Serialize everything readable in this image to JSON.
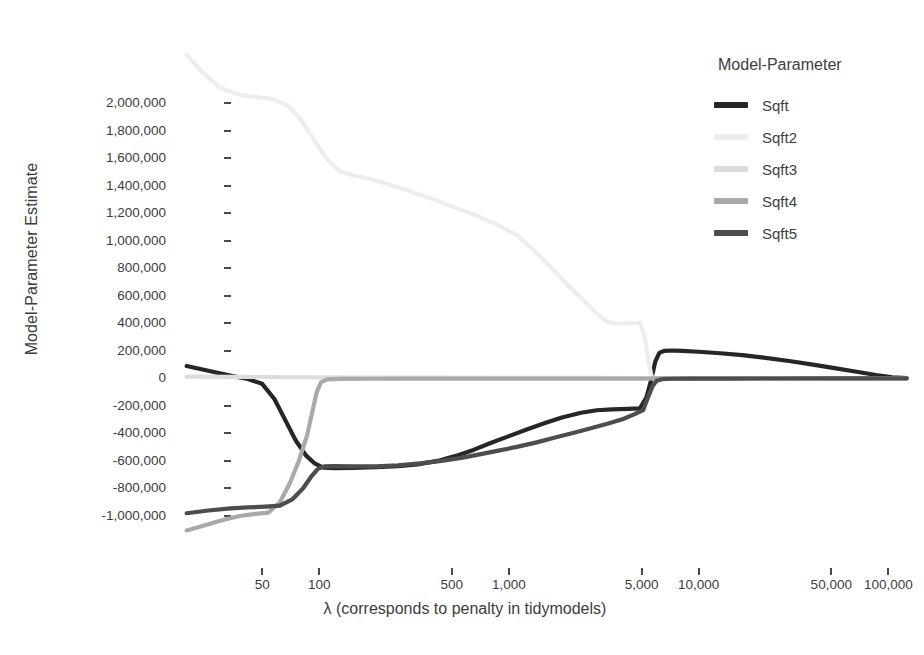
{
  "chart_data": {
    "type": "line",
    "title": "",
    "xlabel": "λ (corresponds to penalty in tidymodels)",
    "ylabel": "Model-Parameter Estimate",
    "xscale": "log",
    "xlim": [
      18,
      130000
    ],
    "ylim": [
      -1150000,
      2150000
    ],
    "grid": false,
    "legend": {
      "title": "Model-Parameter",
      "position": "right",
      "entries": [
        "Sqft",
        "Sqft2",
        "Sqft3",
        "Sqft4",
        "Sqft5"
      ]
    },
    "xticks": [
      {
        "value": 50,
        "label": "50"
      },
      {
        "value": 100,
        "label": "100"
      },
      {
        "value": 500,
        "label": "500"
      },
      {
        "value": 1000,
        "label": "1,000"
      },
      {
        "value": 5000,
        "label": "5,000"
      },
      {
        "value": 10000,
        "label": "10,000"
      },
      {
        "value": 50000,
        "label": "50,000"
      },
      {
        "value": 100000,
        "label": "100,000"
      }
    ],
    "yticks": [
      {
        "value": 2000000,
        "label": "2,000,000"
      },
      {
        "value": 1800000,
        "label": "1,800,000"
      },
      {
        "value": 1600000,
        "label": "1,600,000"
      },
      {
        "value": 1400000,
        "label": "1,400,000"
      },
      {
        "value": 1200000,
        "label": "1,200,000"
      },
      {
        "value": 1000000,
        "label": "1,000,000"
      },
      {
        "value": 800000,
        "label": "800,000"
      },
      {
        "value": 600000,
        "label": "600,000"
      },
      {
        "value": 400000,
        "label": "400,000"
      },
      {
        "value": 200000,
        "label": "200,000"
      },
      {
        "value": 0,
        "label": "0"
      },
      {
        "value": -200000,
        "label": "-200,000"
      },
      {
        "value": -400000,
        "label": "-400,000"
      },
      {
        "value": -600000,
        "label": "-600,000"
      },
      {
        "value": -800000,
        "label": "-800,000"
      },
      {
        "value": -1000000,
        "label": "-1,000,000"
      }
    ],
    "series": [
      {
        "name": "Sqft",
        "color": "#262626",
        "width": 4.2,
        "points": [
          [
            20,
            90000
          ],
          [
            26,
            55000
          ],
          [
            34,
            20000
          ],
          [
            42,
            -5000
          ],
          [
            50,
            -40000
          ],
          [
            58,
            -150000
          ],
          [
            66,
            -300000
          ],
          [
            75,
            -450000
          ],
          [
            85,
            -560000
          ],
          [
            95,
            -620000
          ],
          [
            105,
            -648000
          ],
          [
            120,
            -652000
          ],
          [
            150,
            -650000
          ],
          [
            200,
            -645000
          ],
          [
            260,
            -638000
          ],
          [
            330,
            -625000
          ],
          [
            420,
            -600000
          ],
          [
            520,
            -565000
          ],
          [
            650,
            -520000
          ],
          [
            800,
            -470000
          ],
          [
            1000,
            -420000
          ],
          [
            1250,
            -370000
          ],
          [
            1550,
            -325000
          ],
          [
            1900,
            -285000
          ],
          [
            2400,
            -250000
          ],
          [
            2900,
            -232000
          ],
          [
            3500,
            -225000
          ],
          [
            4200,
            -222000
          ],
          [
            4900,
            -218000
          ],
          [
            5300,
            -140000
          ],
          [
            5600,
            -20000
          ],
          [
            5900,
            120000
          ],
          [
            6200,
            185000
          ],
          [
            6600,
            200000
          ],
          [
            7200,
            202000
          ],
          [
            8200,
            200000
          ],
          [
            10000,
            193000
          ],
          [
            13000,
            182000
          ],
          [
            17000,
            168000
          ],
          [
            22000,
            150000
          ],
          [
            30000,
            126000
          ],
          [
            40000,
            100000
          ],
          [
            52000,
            74000
          ],
          [
            68000,
            48000
          ],
          [
            86000,
            24000
          ],
          [
            105000,
            8000
          ],
          [
            125000,
            2000
          ]
        ]
      },
      {
        "name": "Sqft2",
        "color": "#ededed",
        "width": 4.2,
        "points": [
          [
            20,
            2350000
          ],
          [
            24,
            2230000
          ],
          [
            30,
            2110000
          ],
          [
            38,
            2060000
          ],
          [
            46,
            2045000
          ],
          [
            56,
            2030000
          ],
          [
            68,
            1985000
          ],
          [
            80,
            1880000
          ],
          [
            95,
            1720000
          ],
          [
            110,
            1590000
          ],
          [
            130,
            1500000
          ],
          [
            155,
            1470000
          ],
          [
            185,
            1450000
          ],
          [
            230,
            1410000
          ],
          [
            300,
            1360000
          ],
          [
            400,
            1300000
          ],
          [
            520,
            1240000
          ],
          [
            680,
            1180000
          ],
          [
            870,
            1115000
          ],
          [
            1100,
            1040000
          ],
          [
            1350,
            930000
          ],
          [
            1650,
            810000
          ],
          [
            2000,
            690000
          ],
          [
            2450,
            570000
          ],
          [
            2900,
            470000
          ],
          [
            3300,
            410000
          ],
          [
            3700,
            398000
          ],
          [
            4300,
            400000
          ],
          [
            4900,
            405000
          ],
          [
            5200,
            300000
          ],
          [
            5450,
            120000
          ],
          [
            5650,
            10000
          ],
          [
            6000,
            2000
          ],
          [
            8000,
            1000
          ],
          [
            20000,
            500
          ],
          [
            60000,
            200
          ],
          [
            125000,
            0
          ]
        ]
      },
      {
        "name": "Sqft3",
        "color": "#dcdcdc",
        "width": 4.2,
        "points": [
          [
            20,
            12000
          ],
          [
            40,
            10000
          ],
          [
            80,
            8000
          ],
          [
            160,
            6000
          ],
          [
            400,
            5000
          ],
          [
            1000,
            4000
          ],
          [
            2500,
            3000
          ],
          [
            5000,
            2000
          ],
          [
            10000,
            1500
          ],
          [
            30000,
            1000
          ],
          [
            70000,
            500
          ],
          [
            125000,
            0
          ]
        ]
      },
      {
        "name": "Sqft4",
        "color": "#a9a9a9",
        "width": 4.2,
        "points": [
          [
            20,
            -1105000
          ],
          [
            24,
            -1075000
          ],
          [
            30,
            -1035000
          ],
          [
            38,
            -1000000
          ],
          [
            46,
            -985000
          ],
          [
            54,
            -975000
          ],
          [
            62,
            -900000
          ],
          [
            70,
            -760000
          ],
          [
            78,
            -600000
          ],
          [
            86,
            -420000
          ],
          [
            92,
            -240000
          ],
          [
            97,
            -100000
          ],
          [
            102,
            -30000
          ],
          [
            110,
            -8000
          ],
          [
            130,
            -4000
          ],
          [
            180,
            -3000
          ],
          [
            300,
            -2500
          ],
          [
            700,
            -2000
          ],
          [
            1600,
            -1800
          ],
          [
            3000,
            -1600
          ],
          [
            5000,
            -1400
          ],
          [
            5400,
            -1200
          ],
          [
            6000,
            -900
          ],
          [
            10000,
            -600
          ],
          [
            30000,
            -300
          ],
          [
            70000,
            -100
          ],
          [
            125000,
            0
          ]
        ]
      },
      {
        "name": "Sqft5",
        "color": "#4d4d4d",
        "width": 4.2,
        "points": [
          [
            20,
            -980000
          ],
          [
            26,
            -960000
          ],
          [
            34,
            -945000
          ],
          [
            42,
            -938000
          ],
          [
            52,
            -932000
          ],
          [
            62,
            -925000
          ],
          [
            72,
            -880000
          ],
          [
            82,
            -800000
          ],
          [
            90,
            -720000
          ],
          [
            98,
            -660000
          ],
          [
            106,
            -640000
          ],
          [
            120,
            -638000
          ],
          [
            150,
            -640000
          ],
          [
            200,
            -640000
          ],
          [
            260,
            -632000
          ],
          [
            340,
            -618000
          ],
          [
            440,
            -600000
          ],
          [
            560,
            -578000
          ],
          [
            700,
            -552000
          ],
          [
            880,
            -525000
          ],
          [
            1100,
            -498000
          ],
          [
            1400,
            -465000
          ],
          [
            1750,
            -430000
          ],
          [
            2200,
            -395000
          ],
          [
            2700,
            -362000
          ],
          [
            3300,
            -330000
          ],
          [
            4000,
            -295000
          ],
          [
            4600,
            -260000
          ],
          [
            5100,
            -230000
          ],
          [
            5400,
            -140000
          ],
          [
            5700,
            -60000
          ],
          [
            6000,
            -18000
          ],
          [
            6400,
            -6000
          ],
          [
            7200,
            -3000
          ],
          [
            9000,
            -2000
          ],
          [
            14000,
            -1500
          ],
          [
            25000,
            -1200
          ],
          [
            50000,
            -800
          ],
          [
            90000,
            -400
          ],
          [
            125000,
            0
          ]
        ]
      }
    ]
  }
}
